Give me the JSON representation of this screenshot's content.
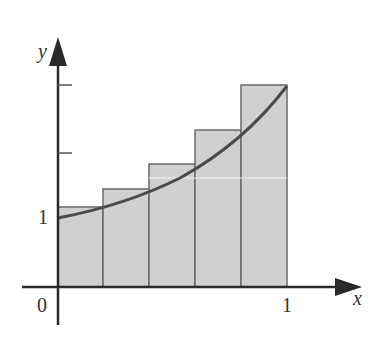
{
  "diagram": {
    "colors": {
      "axis": "#2a2a2a",
      "curve": "#4a4a4a",
      "rect_fill": "#d0d0d0",
      "rect_stroke": "#6a6a6a"
    },
    "labels": {
      "y_axis": "y",
      "x_axis": "x",
      "origin": "0",
      "x_tick_1": "1",
      "y_tick_1": "1"
    },
    "rectangles": [
      {
        "x0": 0.0,
        "x1": 0.2,
        "height": 1.1
      },
      {
        "x0": 0.2,
        "x1": 0.4,
        "height": 1.4
      },
      {
        "x0": 0.4,
        "x1": 0.6,
        "height": 1.8
      },
      {
        "x0": 0.6,
        "x1": 0.8,
        "height": 2.3
      },
      {
        "x0": 0.8,
        "x1": 1.0,
        "height": 3.0
      }
    ],
    "y_ticks": [
      1,
      2,
      3
    ]
  }
}
